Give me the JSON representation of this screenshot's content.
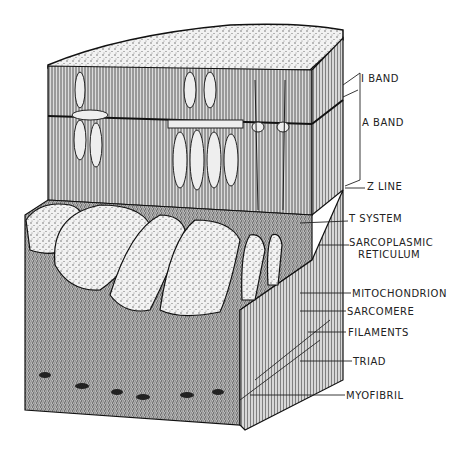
{
  "figure": {
    "labels": [
      {
        "id": "i-band",
        "text": "I BAND"
      },
      {
        "id": "a-band",
        "text": "A BAND"
      },
      {
        "id": "z-line",
        "text": "Z LINE"
      },
      {
        "id": "t-system",
        "text": "T SYSTEM"
      },
      {
        "id": "sarcoplasmic-reticulum-1",
        "text": "SARCOPLASMIC"
      },
      {
        "id": "sarcoplasmic-reticulum-2",
        "text": "RETICULUM"
      },
      {
        "id": "mitochondrion",
        "text": "MITOCHONDRION"
      },
      {
        "id": "sarcomere",
        "text": "SARCOMERE"
      },
      {
        "id": "filaments",
        "text": "FILAMENTS"
      },
      {
        "id": "triad",
        "text": "TRIAD"
      },
      {
        "id": "myofibril",
        "text": "MYOFIBRIL"
      }
    ]
  }
}
